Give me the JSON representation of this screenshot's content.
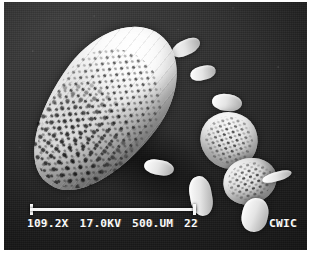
{
  "figure": {
    "kind": "sem-micrograph",
    "background_color": "#2b2b2b",
    "specimen_color": "#f2f2f2"
  },
  "info_bar": {
    "magnification": "109.2X",
    "accelerating_voltage": "17.0KV",
    "scale_length": "500.UM",
    "frame_number": "22",
    "lab_id": "CWIC",
    "scale_bar": {
      "label": "500.UM",
      "present": true
    }
  }
}
